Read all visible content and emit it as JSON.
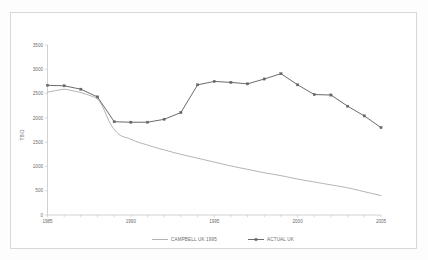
{
  "chart_data": {
    "type": "line",
    "title": "",
    "xlabel": "",
    "ylabel": "TB/D",
    "xlim": [
      1985,
      2005
    ],
    "ylim": [
      0,
      3500
    ],
    "ytick_labels": [
      "0",
      "500",
      "1000",
      "1500",
      "2000",
      "2500",
      "3000",
      "3500"
    ],
    "ytick_values": [
      0,
      500,
      1000,
      1500,
      2000,
      2500,
      3000,
      3500
    ],
    "xtick_labels": [
      "1985",
      "1990",
      "1995",
      "2000",
      "2005"
    ],
    "xtick_values": [
      1985,
      1990,
      1995,
      2000,
      2005
    ],
    "grid": false,
    "legend_position": "bottom",
    "x": [
      1985,
      1986,
      1987,
      1988,
      1989,
      1990,
      1991,
      1992,
      1993,
      1994,
      1995,
      1996,
      1997,
      1998,
      1999,
      2000,
      2001,
      2002,
      2003,
      2004,
      2005
    ],
    "series": [
      {
        "name": "CAMPBELL UK 1995",
        "color": "#9a9a9a",
        "marker": "none",
        "values": [
          2530,
          2590,
          2520,
          2390,
          1760,
          1560,
          1440,
          1340,
          1250,
          1170,
          1090,
          1010,
          940,
          870,
          810,
          740,
          680,
          620,
          560,
          480,
          400
        ]
      },
      {
        "name": "ACTUAL UK",
        "color": "#636363",
        "marker": "square",
        "values": [
          2670,
          2660,
          2590,
          2430,
          1920,
          1910,
          1910,
          1970,
          2110,
          2680,
          2750,
          2730,
          2700,
          2800,
          2910,
          2680,
          2480,
          2470,
          2240,
          2040,
          1800
        ]
      }
    ]
  },
  "legend": {
    "items": [
      {
        "label": "CAMPBELL UK 1995"
      },
      {
        "label": "ACTUAL UK"
      }
    ]
  },
  "axes": {
    "y_title": "TB/D"
  }
}
